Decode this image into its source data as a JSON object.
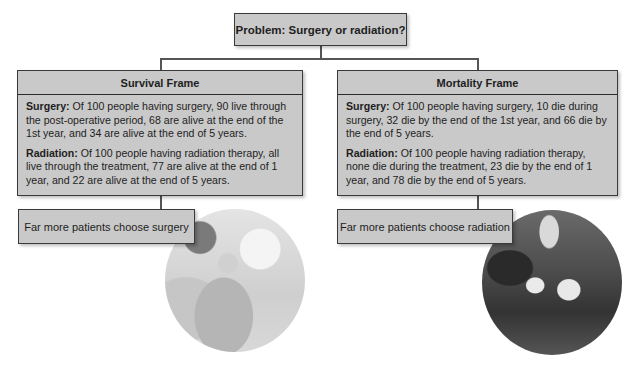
{
  "problem": {
    "label": "Problem: Surgery or radiation?"
  },
  "frames": [
    {
      "title": "Survival Frame",
      "surgery_label": "Surgery:",
      "surgery_text": " Of 100 people having surgery, 90 live through the post-operative period, 68 are alive at the end of the 1st year, and 34 are alive at the end of 5 years.",
      "radiation_label": "Radiation:",
      "radiation_text": " Of 100 people having radiation therapy, all live through the treatment, 77 are alive at the end of 1 year, and 22 are alive at the end of 5 years.",
      "outcome": "Far more patients choose surgery",
      "image": "surgery-team-photo"
    },
    {
      "title": "Mortality Frame",
      "surgery_label": "Surgery:",
      "surgery_text": " Of 100 people having surgery, 10 die during surgery, 32 die by the end of the 1st year, and 66 die by the end of 5 years.",
      "radiation_label": "Radiation:",
      "radiation_text": " Of 100 people having radiation therapy, none die during the treatment, 23 die by the end of 1 year, and 78 die by the end of 5 years.",
      "outcome": "Far more patients choose radiation",
      "image": "radiation-therapy-photo"
    }
  ],
  "colors": {
    "box_fill": "#c9c9c9",
    "border": "#3a3a3a",
    "connector": "#555555"
  }
}
